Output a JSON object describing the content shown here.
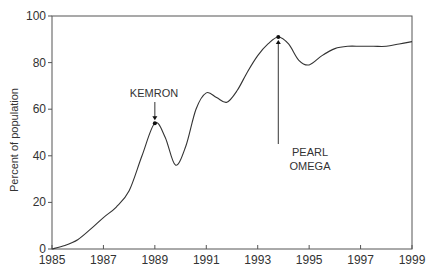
{
  "chart_data": {
    "type": "line",
    "title": "",
    "xlabel": "",
    "ylabel": "Percent of population",
    "xlim": [
      1985,
      1999
    ],
    "ylim": [
      0,
      100
    ],
    "x_ticks": [
      1985,
      1987,
      1989,
      1991,
      1993,
      1995,
      1997,
      1999
    ],
    "y_ticks": [
      0,
      20,
      40,
      60,
      80,
      100
    ],
    "grid": false,
    "legend": null,
    "series": [
      {
        "name": "Percent of population",
        "x": [
          1985,
          1985.5,
          1986,
          1986.5,
          1987,
          1987.5,
          1988,
          1988.5,
          1989,
          1989.4,
          1989.8,
          1990.2,
          1990.6,
          1991,
          1991.4,
          1991.8,
          1992.2,
          1992.6,
          1993,
          1993.4,
          1993.8,
          1994.2,
          1994.6,
          1995,
          1995.5,
          1996,
          1996.5,
          1997,
          1997.5,
          1998,
          1998.5,
          1999
        ],
        "y": [
          0,
          1.5,
          4,
          8.5,
          13.5,
          18,
          25,
          40,
          54,
          48,
          36,
          44,
          60,
          67,
          65,
          63,
          68,
          76,
          83,
          88,
          91,
          88,
          81,
          79,
          83,
          86,
          87,
          87,
          87,
          87,
          88,
          89
        ]
      }
    ],
    "annotations": [
      {
        "text": "KEMRON",
        "x": 1989,
        "y": 54,
        "arrow": "down"
      },
      {
        "text": "PEARL\nOMEGA",
        "x": 1993.8,
        "y": 91,
        "arrow": "up"
      }
    ]
  },
  "labels": {
    "ylabel": "Percent of population",
    "kemron": "KEMRON",
    "pearl_line1": "PEARL",
    "pearl_line2": "OMEGA"
  }
}
